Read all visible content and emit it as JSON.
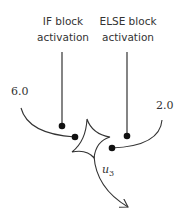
{
  "diagram": {
    "if_label": {
      "line1": "IF block",
      "line2": "activation"
    },
    "else_label": {
      "line1": "ELSE block",
      "line2": "activation"
    },
    "input_left_value": "6.0",
    "input_right_value": "2.0",
    "output_label": {
      "var": "u",
      "sub": "3"
    },
    "colors": {
      "stroke": "#333333",
      "text": "#333333"
    }
  }
}
